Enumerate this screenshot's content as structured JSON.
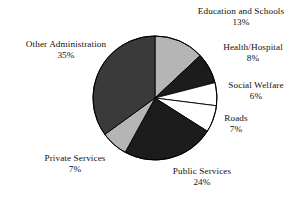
{
  "chart_data": {
    "type": "pie",
    "title": "",
    "xlabel": "",
    "ylabel": "",
    "legend_position": "none",
    "grid": false,
    "start_angle_deg": 0,
    "direction": "clockwise",
    "categories": [
      "Education and Schools",
      "Health/Hospital",
      "Social Welfare",
      "Roads",
      "Public Services",
      "Private Services",
      "Other Administration"
    ],
    "values": [
      13,
      8,
      6,
      7,
      24,
      7,
      35
    ],
    "value_unit": "%",
    "slices": [
      {
        "label": "Education and Schools",
        "percent_text": "13%",
        "value": 13,
        "color": "#b5b5b5"
      },
      {
        "label": "Health/Hospital",
        "percent_text": "8%",
        "value": 8,
        "color": "#1c1c1c"
      },
      {
        "label": "Social Welfare",
        "percent_text": "6%",
        "value": 6,
        "color": "#ffffff"
      },
      {
        "label": "Roads",
        "percent_text": "7%",
        "value": 7,
        "color": "#ffffff"
      },
      {
        "label": "Public Services",
        "percent_text": "24%",
        "value": 24,
        "color": "#1c1c1c"
      },
      {
        "label": "Private Services",
        "percent_text": "7%",
        "value": 7,
        "color": "#b5b5b5"
      },
      {
        "label": "Other Administration",
        "percent_text": "35%",
        "value": 35,
        "color": "#3a3a3a"
      }
    ],
    "colors": {
      "light_gray": "#b5b5b5",
      "dark_gray": "#3a3a3a",
      "near_black": "#1c1c1c",
      "white": "#ffffff",
      "outline": "#000000",
      "text": "#111111",
      "background": "#ffffff"
    }
  }
}
